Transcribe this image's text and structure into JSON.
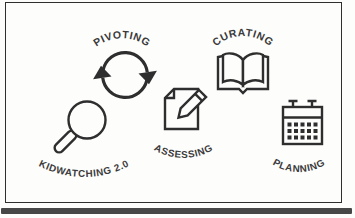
{
  "figure": {
    "background": "#fdfdfc",
    "frame_border_color": "#2f2f2f",
    "bottom_bar_color": "#474747",
    "line_color": "#2e2e2e",
    "text_color": "#3a3a3a"
  },
  "diagram": {
    "items": [
      {
        "id": "pivoting",
        "label": "PIVOTING",
        "icon": "cycle-arrows-icon",
        "label_position": "arched-above"
      },
      {
        "id": "curating",
        "label": "CURATING",
        "icon": "open-book-icon",
        "label_position": "arched-above"
      },
      {
        "id": "kidwatching",
        "label": "KIDWATCHING 2.0",
        "icon": "magnifying-glass-icon",
        "label_position": "arched-below"
      },
      {
        "id": "assessing",
        "label": "ASSESSING",
        "icon": "document-pencil-icon",
        "label_position": "arched-below"
      },
      {
        "id": "planning",
        "label": "PLANNING",
        "icon": "calendar-icon",
        "label_position": "arched-below"
      }
    ]
  }
}
